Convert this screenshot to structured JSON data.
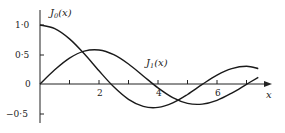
{
  "chart_data": {
    "type": "line",
    "title": "",
    "xlabel": "x",
    "ylabel": "",
    "xlim": [
      0,
      7.6
    ],
    "ylim": [
      -0.5,
      1.0
    ],
    "grid": false,
    "legend": "inline labels",
    "x_ticks": [
      1,
      2,
      3,
      4,
      5,
      6,
      7
    ],
    "x_tick_labels": [
      {
        "value": 2,
        "label": "2"
      },
      {
        "value": 4,
        "label": "4"
      },
      {
        "value": 6,
        "label": "6"
      }
    ],
    "y_tick_labels": [
      {
        "value": 1.0,
        "label": "1·0"
      },
      {
        "value": 0.5,
        "label": "0·5"
      },
      {
        "value": 0,
        "label": "0"
      },
      {
        "value": -0.5,
        "label": "−0·5"
      }
    ],
    "x": [
      0,
      0.5,
      1,
      1.5,
      2,
      2.5,
      3,
      3.5,
      4,
      4.5,
      5,
      5.5,
      6,
      6.5,
      7,
      7.4
    ],
    "series": [
      {
        "name": "J₀(x)",
        "label_main": "J",
        "label_sub": "0",
        "label_arg": "(x)",
        "values": [
          1.0,
          0.938,
          0.765,
          0.512,
          0.224,
          -0.048,
          -0.26,
          -0.38,
          -0.397,
          -0.321,
          -0.178,
          -0.007,
          0.151,
          0.26,
          0.3,
          0.261
        ]
      },
      {
        "name": "J₁(x)",
        "label_main": "J",
        "label_sub": "1",
        "label_arg": "(x)",
        "values": [
          0.0,
          0.242,
          0.44,
          0.558,
          0.577,
          0.497,
          0.339,
          0.137,
          -0.066,
          -0.231,
          -0.328,
          -0.341,
          -0.277,
          -0.154,
          -0.005,
          0.113
        ]
      }
    ],
    "annotations": [
      {
        "text": "J₀(x)",
        "near": "curve start at y=1"
      },
      {
        "text": "J₁(x)",
        "near": "x≈3.6, y≈0.4"
      }
    ]
  },
  "labels": {
    "x_axis": "x",
    "y1": "1·0",
    "y05": "0·5",
    "y0": "0",
    "ym05": "−0·5",
    "x2": "2",
    "x4": "4",
    "x6": "6",
    "j0_main": "J",
    "j0_sub": "0",
    "j0_arg": "(x)",
    "j1_main": "J",
    "j1_sub": "1",
    "j1_arg": "(x)"
  }
}
